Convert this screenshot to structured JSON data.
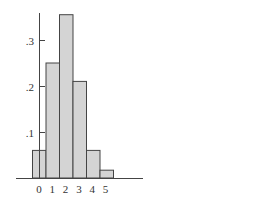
{
  "chart_data": {
    "type": "bar",
    "title": "",
    "xlabel": "",
    "ylabel": "",
    "categories": [
      "0",
      "1",
      "2",
      "3",
      "4",
      "5"
    ],
    "values": [
      0.06,
      0.25,
      0.355,
      0.21,
      0.06,
      0.017
    ],
    "ylim": [
      0,
      0.36
    ],
    "yticks": [
      ".1",
      ".2",
      ".3"
    ],
    "ytick_values": [
      0.1,
      0.2,
      0.3
    ],
    "grid": false,
    "bar_color": "#d4d4d4",
    "edge_color": "#444444",
    "bar_style": "histogram (adjacent bars, no gaps)"
  }
}
